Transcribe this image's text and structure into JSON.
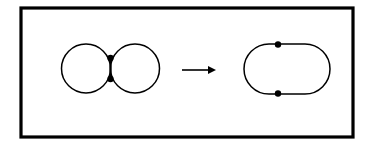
{
  "figure": {
    "caption": "",
    "background_color": "#ffffff",
    "stroke_color": "#000000",
    "frame": {
      "name": "outer-rectangle-border",
      "x": 21,
      "y": 8,
      "width": 332,
      "height": 129,
      "stroke_width": 3.2,
      "fill": "none"
    },
    "left_figure": {
      "label": "two-tangent-circles-with-edge",
      "description": "Two circles joined at a vertical segment with two marked vertices",
      "circles": [
        {
          "name": "left-circle",
          "cx": 86,
          "cy": 68.5,
          "r": 24.5
        },
        {
          "name": "right-circle",
          "cx": 135,
          "cy": 68.5,
          "r": 24.5
        }
      ],
      "connecting_edge": {
        "x": 110.5,
        "y1": 58,
        "y2": 79
      },
      "vertices": [
        {
          "name": "upper-vertex",
          "cx": 110.5,
          "cy": 58,
          "r": 3.2
        },
        {
          "name": "lower-vertex",
          "cx": 110.5,
          "cy": 79,
          "r": 3.2
        }
      ],
      "stroke_width": 1.5
    },
    "arrow": {
      "label": "transformation-arrow",
      "direction": "right",
      "x1": 182,
      "x2": 216,
      "y": 70,
      "stroke_width": 1.6,
      "head_length": 8,
      "head_half_width": 4
    },
    "right_figure": {
      "label": "stadium-oval-with-two-vertices",
      "description": "A single closed stadium-shaped curve with two marked vertices",
      "outline": {
        "name": "oval-outline",
        "x": 244,
        "y": 44,
        "width": 86,
        "height": 50,
        "corner_radius": 25
      },
      "vertices": [
        {
          "name": "top-vertex",
          "cx": 278,
          "cy": 44.5,
          "r": 3.2
        },
        {
          "name": "bottom-vertex",
          "cx": 278,
          "cy": 93.5,
          "r": 3.2
        }
      ],
      "stroke_width": 1.5
    }
  }
}
